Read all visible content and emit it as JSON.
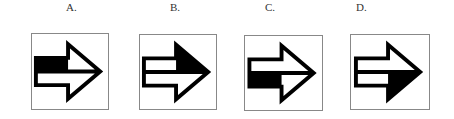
{
  "options": [
    {
      "label": "A.",
      "arrow": {
        "shaft_top": "#000000",
        "shaft_bottom": "#ffffff",
        "head_top": "#ffffff",
        "head_bottom": "#ffffff"
      }
    },
    {
      "label": "B.",
      "arrow": {
        "shaft_top": "#ffffff",
        "shaft_bottom": "#ffffff",
        "head_top": "#000000",
        "head_bottom": "#ffffff"
      }
    },
    {
      "label": "C.",
      "arrow": {
        "shaft_top": "#ffffff",
        "shaft_bottom": "#000000",
        "head_top": "#ffffff",
        "head_bottom": "#ffffff"
      }
    },
    {
      "label": "D.",
      "arrow": {
        "shaft_top": "#ffffff",
        "shaft_bottom": "#ffffff",
        "head_top": "#ffffff",
        "head_bottom": "#000000"
      }
    }
  ],
  "icons": {
    "arrow": "right-arrow-icon"
  }
}
